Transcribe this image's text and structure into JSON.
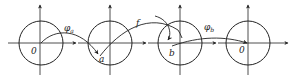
{
  "diagram": {
    "stroke_color": "#222222",
    "background": "#ffffff",
    "frames": [
      {
        "id": "frame-1",
        "cx": 41,
        "cy": 43,
        "r": 22,
        "origin_label": "0"
      },
      {
        "id": "frame-2",
        "cx": 110,
        "cy": 43,
        "r": 22,
        "point_label": "a"
      },
      {
        "id": "frame-3",
        "cx": 180,
        "cy": 43,
        "r": 22,
        "point_label": "b"
      },
      {
        "id": "frame-4",
        "cx": 248,
        "cy": 43,
        "r": 22,
        "origin_label": "0"
      }
    ],
    "arrows": [
      {
        "id": "phi-a",
        "label_main": "φ",
        "label_sub": "a",
        "from": "frame-1 origin",
        "to": "point a"
      },
      {
        "id": "f",
        "label_main": "f",
        "label_sub": "",
        "from": "point a",
        "to": "point b"
      },
      {
        "id": "phi-b",
        "label_main": "φ",
        "label_sub": "b",
        "from": "point b",
        "to": "frame-4 origin"
      }
    ],
    "labels": {
      "origin_1": "0",
      "point_a": "a",
      "point_b": "b",
      "origin_4": "0",
      "phi": "φ",
      "sub_a": "a",
      "sub_b": "b",
      "f": "f"
    }
  }
}
